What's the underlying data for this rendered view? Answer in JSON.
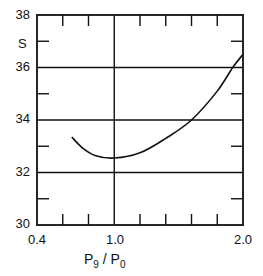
{
  "chart_data": {
    "type": "line",
    "title": "",
    "xlabel": "P9 / P0",
    "xlabel_main": "P",
    "xlabel_sub1": "9",
    "xlabel_slash": " / ",
    "xlabel_main2": "P",
    "xlabel_sub2": "0",
    "ylabel": "S",
    "xlim": [
      0.4,
      2.0
    ],
    "ylim": [
      30,
      38
    ],
    "x_tick_labels": [
      "0.4",
      "1.0",
      "2.0"
    ],
    "y_tick_labels": [
      "30",
      "32",
      "34",
      "36",
      "38"
    ],
    "grid": {
      "horizontal_at": [
        32,
        34,
        36
      ],
      "vertical_at": [
        1.0
      ]
    },
    "minor_x_ticks": [
      0.6,
      0.8,
      1.2,
      1.4,
      1.6,
      1.8
    ],
    "minor_y_ticks": [
      31,
      33,
      35,
      37
    ],
    "legend": null,
    "series": [
      {
        "name": "S",
        "x": [
          0.67,
          0.75,
          0.85,
          1.0,
          1.2,
          1.4,
          1.6,
          1.8,
          1.92,
          2.0
        ],
        "values": [
          33.35,
          32.95,
          32.65,
          32.55,
          32.75,
          33.3,
          34.0,
          35.1,
          36.0,
          36.5
        ]
      }
    ]
  }
}
